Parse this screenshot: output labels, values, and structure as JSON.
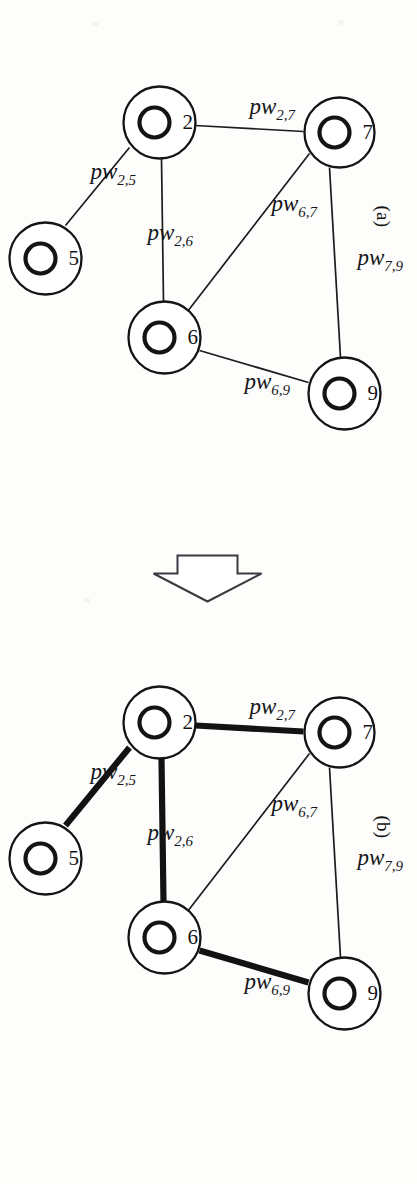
{
  "figure": {
    "kind": "two-panel-graph-diagram",
    "orientation": "rotated-90-ccw",
    "background_color": "#fdfdfc",
    "ink_color": "#141414"
  },
  "panels": [
    {
      "id": "a",
      "label": "(a)",
      "caption_position": "top-left",
      "edge_style": "all-thin",
      "nodes": [
        {
          "id": "7",
          "label": "7",
          "cx": 132,
          "cy": 78,
          "r_outer": 35,
          "r_inner": 15
        },
        {
          "id": "2",
          "label": "2",
          "cx": 122,
          "cy": 258,
          "r_outer": 36,
          "r_inner": 15
        },
        {
          "id": "5",
          "label": "5",
          "cx": 258,
          "cy": 372,
          "r_outer": 36,
          "r_inner": 15
        },
        {
          "id": "6",
          "label": "6",
          "cx": 337,
          "cy": 253,
          "r_outer": 36,
          "r_inner": 15
        },
        {
          "id": "9",
          "label": "9",
          "cx": 393,
          "cy": 73,
          "r_outer": 36,
          "r_inner": 15
        }
      ],
      "edges": [
        {
          "id": "pw_2_7",
          "from": "2",
          "to": "7",
          "weight_base": "pw",
          "weight_sub": "2,7",
          "thick": false,
          "lx": 113,
          "ly": 168,
          "rot": -90
        },
        {
          "id": "pw_2_5",
          "from": "2",
          "to": "5",
          "weight_base": "pw",
          "weight_sub": "2,5",
          "thick": false,
          "lx": 178,
          "ly": 327,
          "rot": -90
        },
        {
          "id": "pw_2_6",
          "from": "2",
          "to": "6",
          "weight_base": "pw",
          "weight_sub": "2,6",
          "thick": false,
          "lx": 239,
          "ly": 270,
          "rot": -90
        },
        {
          "id": "pw_6_7",
          "from": "6",
          "to": "7",
          "weight_base": "pw",
          "weight_sub": "6,7",
          "thick": false,
          "lx": 210,
          "ly": 146,
          "rot": -90
        },
        {
          "id": "pw_6_9",
          "from": "6",
          "to": "9",
          "weight_base": "pw",
          "weight_sub": "6,9",
          "thick": false,
          "lx": 388,
          "ly": 173,
          "rot": -90
        },
        {
          "id": "pw_7_9",
          "from": "7",
          "to": "9",
          "weight_base": "pw",
          "weight_sub": "7,9",
          "thick": false,
          "lx": 264,
          "ly": 60,
          "rot": -90
        }
      ]
    },
    {
      "id": "b",
      "label": "(b)",
      "caption_position": "top-left",
      "edge_style": "selected-thick",
      "nodes": [
        {
          "id": "7",
          "label": "7",
          "cx": 132,
          "cy": 78,
          "r_outer": 35,
          "r_inner": 15
        },
        {
          "id": "2",
          "label": "2",
          "cx": 122,
          "cy": 258,
          "r_outer": 36,
          "r_inner": 15
        },
        {
          "id": "5",
          "label": "5",
          "cx": 258,
          "cy": 372,
          "r_outer": 36,
          "r_inner": 15
        },
        {
          "id": "6",
          "label": "6",
          "cx": 337,
          "cy": 253,
          "r_outer": 36,
          "r_inner": 15
        },
        {
          "id": "9",
          "label": "9",
          "cx": 393,
          "cy": 73,
          "r_outer": 36,
          "r_inner": 15
        }
      ],
      "edges": [
        {
          "id": "pw_2_7",
          "from": "2",
          "to": "7",
          "weight_base": "pw",
          "weight_sub": "2,7",
          "thick": true,
          "lx": 113,
          "ly": 168,
          "rot": -90
        },
        {
          "id": "pw_2_5",
          "from": "2",
          "to": "5",
          "weight_base": "pw",
          "weight_sub": "2,5",
          "thick": true,
          "lx": 178,
          "ly": 327,
          "rot": -90
        },
        {
          "id": "pw_2_6",
          "from": "2",
          "to": "6",
          "weight_base": "pw",
          "weight_sub": "2,6",
          "thick": true,
          "lx": 239,
          "ly": 270,
          "rot": -90
        },
        {
          "id": "pw_6_7",
          "from": "6",
          "to": "7",
          "weight_base": "pw",
          "weight_sub": "6,7",
          "thick": false,
          "lx": 210,
          "ly": 146,
          "rot": -90
        },
        {
          "id": "pw_6_9",
          "from": "6",
          "to": "9",
          "weight_base": "pw",
          "weight_sub": "6,9",
          "thick": true,
          "lx": 388,
          "ly": 173,
          "rot": -90
        },
        {
          "id": "pw_7_9",
          "from": "7",
          "to": "9",
          "weight_base": "pw",
          "weight_sub": "7,9",
          "thick": false,
          "lx": 264,
          "ly": 60,
          "rot": -90
        }
      ]
    }
  ],
  "arrow": {
    "name": "block-arrow",
    "direction": "from-a-to-b",
    "filled": false,
    "outline_color": "#3a3a42"
  }
}
